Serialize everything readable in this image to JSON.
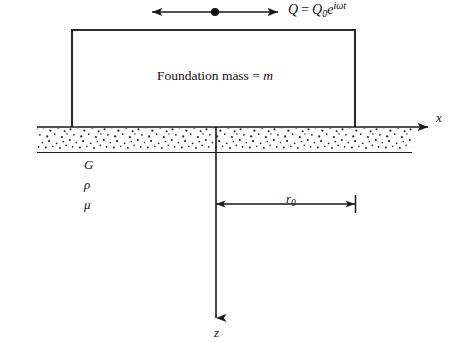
{
  "figure": {
    "background_color": "#ffffff",
    "line_color": "#1a1a1a"
  },
  "excitation": {
    "symbol": "Q",
    "equals": "=",
    "amplitude": "Q",
    "amplitude_subscript": "0",
    "exponential_base": "e",
    "exponential_exponent": "iωt",
    "full_text": "Q = Q₀e^(iωt)",
    "arrow_name": "double-headed-horizontal-arrow",
    "center_dot": true
  },
  "foundation": {
    "label_prefix": "Foundation mass",
    "label_equals": "=",
    "label_variable": "m",
    "full_label": "Foundation mass = m",
    "left_px": 72,
    "right_px": 355,
    "top_px": 30,
    "base_px": 127
  },
  "soil": {
    "properties": [
      {
        "name": "shear-modulus",
        "symbol": "G"
      },
      {
        "name": "mass-density",
        "symbol": "ρ"
      },
      {
        "name": "poisson-ratio",
        "symbol": "μ"
      }
    ],
    "band_top_px": 127,
    "band_bottom_px": 152,
    "band_left_px": 37,
    "band_right_px": 412,
    "hatch_style": "stipple-dots"
  },
  "axes": {
    "x": {
      "label": "x",
      "direction": "right",
      "y_px": 127,
      "start_px": 37,
      "end_px": 430
    },
    "z": {
      "label": "z",
      "direction": "down",
      "x_px": 216,
      "start_px": 127,
      "end_px": 322
    }
  },
  "dimension": {
    "label": "r",
    "label_subscript": "0",
    "full_label": "r₀",
    "meaning": "foundation-radius",
    "y_px": 204,
    "left_px": 216,
    "right_px": 355
  }
}
